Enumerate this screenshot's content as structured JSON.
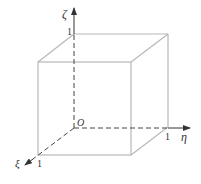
{
  "diagram": {
    "axes": {
      "zeta": {
        "label": "ζ",
        "tick_label": "1"
      },
      "eta": {
        "label": "η",
        "tick_label": "1"
      },
      "xi": {
        "label": "ξ",
        "tick_label": "1"
      }
    },
    "origin_label": "O",
    "colors": {
      "edge": "#b8b8b8",
      "axis": "#444444",
      "text": "#333333"
    }
  }
}
